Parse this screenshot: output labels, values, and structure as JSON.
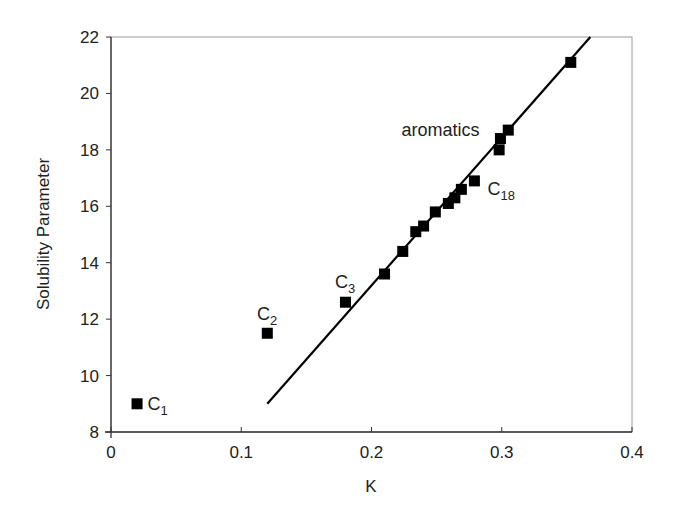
{
  "chart_data": {
    "type": "scatter",
    "title": "",
    "xlabel": "K",
    "ylabel": "Solubility Parameter",
    "xlim": [
      0,
      0.4
    ],
    "ylim": [
      8,
      22
    ],
    "xticks": [
      0,
      0.1,
      0.2,
      0.3,
      0.4
    ],
    "xtick_labels": [
      "0",
      "0.1",
      "0.2",
      "0.3",
      "0.4"
    ],
    "yticks": [
      8,
      10,
      12,
      14,
      16,
      18,
      20,
      22
    ],
    "ytick_labels": [
      "8",
      "10",
      "12",
      "14",
      "16",
      "18",
      "20",
      "22"
    ],
    "grid": false,
    "legend": null,
    "series": [
      {
        "name": "data",
        "marker": "square",
        "color": "#000000",
        "points": [
          {
            "x": 0.02,
            "y": 9.0
          },
          {
            "x": 0.12,
            "y": 11.5
          },
          {
            "x": 0.18,
            "y": 12.6
          },
          {
            "x": 0.21,
            "y": 13.6
          },
          {
            "x": 0.224,
            "y": 14.4
          },
          {
            "x": 0.234,
            "y": 15.1
          },
          {
            "x": 0.24,
            "y": 15.3
          },
          {
            "x": 0.249,
            "y": 15.8
          },
          {
            "x": 0.259,
            "y": 16.1
          },
          {
            "x": 0.264,
            "y": 16.3
          },
          {
            "x": 0.269,
            "y": 16.6
          },
          {
            "x": 0.279,
            "y": 16.9
          },
          {
            "x": 0.298,
            "y": 18.0
          },
          {
            "x": 0.299,
            "y": 18.4
          },
          {
            "x": 0.305,
            "y": 18.7
          },
          {
            "x": 0.353,
            "y": 21.1
          }
        ]
      },
      {
        "name": "fit line",
        "type": "line",
        "color": "#000000",
        "points": [
          {
            "x": 0.12,
            "y": 9.0
          },
          {
            "x": 0.368,
            "y": 22.0
          }
        ]
      }
    ],
    "annotations": [
      {
        "text": "C",
        "sub": "1",
        "x": 0.028,
        "y": 9.0,
        "anchor": "start"
      },
      {
        "text": "C",
        "sub": "2",
        "x": 0.112,
        "y": 12.2,
        "anchor": "start"
      },
      {
        "text": "C",
        "sub": "3",
        "x": 0.172,
        "y": 13.3,
        "anchor": "start"
      },
      {
        "text": "C",
        "sub": "18",
        "x": 0.289,
        "y": 16.6,
        "anchor": "start"
      },
      {
        "text": "aromatics",
        "sub": "",
        "x": 0.223,
        "y": 18.7,
        "anchor": "start"
      }
    ]
  }
}
